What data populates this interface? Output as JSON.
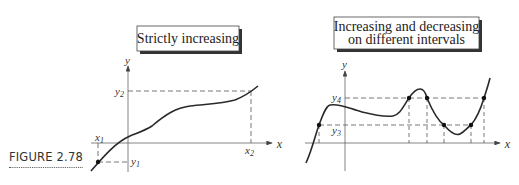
{
  "figure": {
    "caption": "FIGURE 2.78"
  },
  "left_graph": {
    "title": "Strictly increasing",
    "axis_x": "x",
    "axis_y": "y",
    "labels": {
      "x1": "x",
      "x1_sub": "1",
      "x2": "x",
      "x2_sub": "2",
      "y1": "y",
      "y1_sub": "1",
      "y2": "y",
      "y2_sub": "2"
    }
  },
  "right_graph": {
    "title_line1": "Increasing and decreasing",
    "title_line2": "on different intervals",
    "axis_x": "x",
    "axis_y": "y",
    "labels": {
      "y3": "y",
      "y3_sub": "3",
      "y4": "y",
      "y4_sub": "4"
    }
  },
  "colors": {
    "curve": "#2a2a2a",
    "axis": "#555555",
    "dashed": "#555555",
    "box_shadow": "#333333"
  }
}
